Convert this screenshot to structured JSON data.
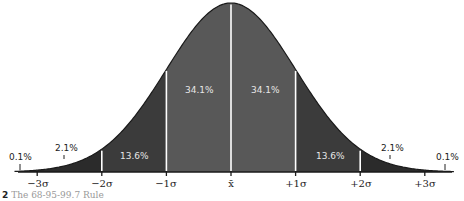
{
  "chart_data": {
    "type": "area",
    "title": "",
    "subtitle": "",
    "xlabel": "",
    "ylabel": "",
    "x_ticks": [
      "−3σ",
      "−2σ",
      "−1σ",
      "x̄",
      "+1σ",
      "+2σ",
      "+3σ"
    ],
    "x_tick_values": [
      -3,
      -2,
      -1,
      0,
      1,
      2,
      3
    ],
    "grid": false,
    "legend": null,
    "bands": [
      {
        "range": [
          -4,
          -3
        ],
        "label": "0.1%",
        "value": 0.1,
        "color": "#2b2b2b"
      },
      {
        "range": [
          -3,
          -2
        ],
        "label": "2.1%",
        "value": 2.1,
        "color": "#2b2b2b"
      },
      {
        "range": [
          -2,
          -1
        ],
        "label": "13.6%",
        "value": 13.6,
        "color": "#3b3b3b"
      },
      {
        "range": [
          -1,
          0
        ],
        "label": "34.1%",
        "value": 34.1,
        "color": "#585858"
      },
      {
        "range": [
          0,
          1
        ],
        "label": "34.1%",
        "value": 34.1,
        "color": "#585858"
      },
      {
        "range": [
          1,
          2
        ],
        "label": "13.6%",
        "value": 13.6,
        "color": "#3b3b3b"
      },
      {
        "range": [
          2,
          3
        ],
        "label": "2.1%",
        "value": 2.1,
        "color": "#2b2b2b"
      },
      {
        "range": [
          3,
          4
        ],
        "label": "0.1%",
        "value": 0.1,
        "color": "#2b2b2b"
      }
    ],
    "divider_color": "#ffffff",
    "curve_color": "#1a1a1a"
  },
  "labels": {
    "tail_left": "0.1%",
    "outer_left": "2.1%",
    "mid_left": "13.6%",
    "inner_left": "34.1%",
    "inner_right": "34.1%",
    "mid_right": "13.6%",
    "outer_right": "2.1%",
    "tail_right": "0.1%"
  },
  "axis": {
    "minus3": "−3σ",
    "minus2": "−2σ",
    "minus1": "−1σ",
    "mean": "x̄",
    "plus1": "+1σ",
    "plus2": "+2σ",
    "plus3": "+3σ"
  },
  "caption": {
    "number": "2",
    "text": "The 68-95-99.7 Rule"
  }
}
